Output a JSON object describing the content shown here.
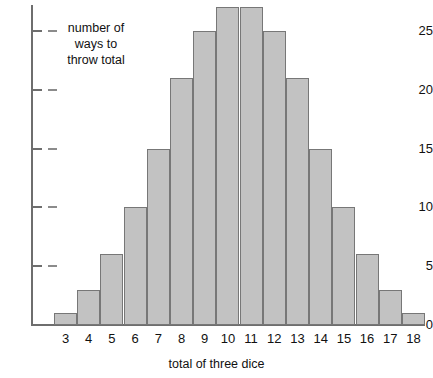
{
  "chart_data": {
    "type": "bar",
    "title": "",
    "subtitle": "",
    "xlabel": "total of three dice",
    "ylabel": "number of ways to throw total",
    "annotation": "number of\nways to\nthrow total",
    "categories": [
      "3",
      "4",
      "5",
      "6",
      "7",
      "8",
      "9",
      "10",
      "11",
      "12",
      "13",
      "14",
      "15",
      "16",
      "17",
      "18"
    ],
    "values": [
      1,
      3,
      6,
      10,
      15,
      21,
      25,
      27,
      27,
      25,
      21,
      15,
      10,
      6,
      3,
      1
    ],
    "ylim": [
      0,
      27
    ],
    "y_axis_max_drawn": 27.2,
    "yticks": [
      0,
      5,
      10,
      15,
      20,
      25
    ],
    "ytick_labels": [
      "0",
      "5",
      "10",
      "15",
      "20",
      "25"
    ],
    "grid": false,
    "legend": null,
    "bar_fill_color": "#c2c2c2",
    "bar_border_color": "#777777",
    "axis_color": "#6e6e6e",
    "text_color": "#111111"
  }
}
